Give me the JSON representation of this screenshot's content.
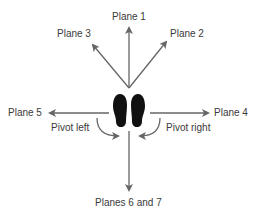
{
  "diagram": {
    "labels": {
      "plane1": "Plane 1",
      "plane2": "Plane 2",
      "plane3": "Plane 3",
      "plane4": "Plane 4",
      "plane5": "Plane 5",
      "planes67": "Planes 6 and 7",
      "pivot_left": "Pivot left",
      "pivot_right": "Pivot right"
    },
    "colors": {
      "arrow": "#666666",
      "feet": "#111111",
      "text": "#3a3a3a"
    }
  }
}
